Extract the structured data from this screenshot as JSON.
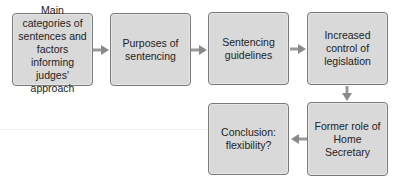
{
  "diagram": {
    "nodes": [
      {
        "id": "main-categories",
        "label": "Main categories of sentences and factors informing judges' approach"
      },
      {
        "id": "purposes",
        "label": "Purposes of sentencing"
      },
      {
        "id": "guidelines",
        "label": "Sentencing guidelines"
      },
      {
        "id": "legislation",
        "label": "Increased control of legislation"
      },
      {
        "id": "home-secretary",
        "label": "Former role of Home Secretary"
      },
      {
        "id": "conclusion",
        "label": "Conclusion: flexibility?"
      }
    ],
    "edges": [
      {
        "from": "main-categories",
        "to": "purposes"
      },
      {
        "from": "purposes",
        "to": "guidelines"
      },
      {
        "from": "guidelines",
        "to": "legislation"
      },
      {
        "from": "legislation",
        "to": "home-secretary"
      },
      {
        "from": "home-secretary",
        "to": "conclusion"
      }
    ],
    "colors": {
      "box_fill": "#d9d9d9",
      "box_border": "#7a7a7a",
      "arrow": "#8a8a8a"
    }
  }
}
